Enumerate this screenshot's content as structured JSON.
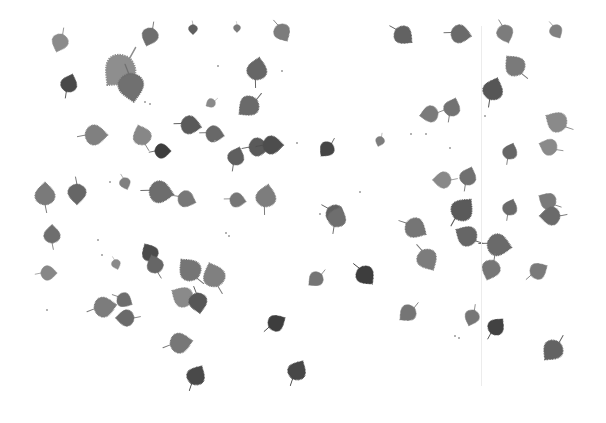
{
  "image": {
    "description": "Grayscale photograph of scattered birch leaves on a white background",
    "width": 606,
    "height": 423,
    "background": "#ffffff",
    "photo_area": {
      "x": 38,
      "y": 26,
      "w": 530,
      "h": 360
    },
    "seam_x": 481
  },
  "leaves": [
    {
      "x": 60,
      "y": 42,
      "s": 9,
      "r": -160,
      "c": "#8a8a8a"
    },
    {
      "x": 150,
      "y": 36,
      "s": 9,
      "r": 200,
      "c": "#6e6e6e"
    },
    {
      "x": 193,
      "y": 29,
      "s": 5,
      "r": 180,
      "c": "#5e5e5e"
    },
    {
      "x": 237,
      "y": 28,
      "s": 4,
      "r": 180,
      "c": "#7a7a7a"
    },
    {
      "x": 282,
      "y": 32,
      "s": 9,
      "r": 150,
      "c": "#7b7b7b"
    },
    {
      "x": 403,
      "y": 35,
      "s": 10,
      "r": 130,
      "c": "#626262"
    },
    {
      "x": 460,
      "y": 34,
      "s": 10,
      "r": 100,
      "c": "#6a6a6a"
    },
    {
      "x": 505,
      "y": 33,
      "s": 9,
      "r": 160,
      "c": "#7c7c7c"
    },
    {
      "x": 556,
      "y": 31,
      "s": 7,
      "r": 150,
      "c": "#808080"
    },
    {
      "x": 120,
      "y": 70,
      "s": 17,
      "r": -140,
      "c": "#8e8e8e"
    },
    {
      "x": 131,
      "y": 86,
      "s": 14,
      "r": 170,
      "c": "#6f6f6f"
    },
    {
      "x": 69,
      "y": 84,
      "s": 9,
      "r": 20,
      "c": "#4a4a4a"
    },
    {
      "x": 257,
      "y": 70,
      "s": 11,
      "r": 10,
      "c": "#666666"
    },
    {
      "x": 249,
      "y": 106,
      "s": 11,
      "r": -130,
      "c": "#6a6a6a"
    },
    {
      "x": 211,
      "y": 103,
      "s": 5,
      "r": -120,
      "c": "#8a8a8a"
    },
    {
      "x": 515,
      "y": 66,
      "s": 11,
      "r": -40,
      "c": "#7a7a7a"
    },
    {
      "x": 493,
      "y": 90,
      "s": 11,
      "r": 20,
      "c": "#575757"
    },
    {
      "x": 430,
      "y": 114,
      "s": 9,
      "r": -100,
      "c": "#7a7a7a"
    },
    {
      "x": 452,
      "y": 108,
      "s": 9,
      "r": 20,
      "c": "#727272"
    },
    {
      "x": 557,
      "y": 122,
      "s": 11,
      "r": -60,
      "c": "#8a8a8a"
    },
    {
      "x": 95,
      "y": 135,
      "s": 11,
      "r": 90,
      "c": "#808080"
    },
    {
      "x": 142,
      "y": 136,
      "s": 10,
      "r": -20,
      "c": "#878787"
    },
    {
      "x": 162,
      "y": 151,
      "s": 8,
      "r": 90,
      "c": "#3e3e3e"
    },
    {
      "x": 190,
      "y": 125,
      "s": 10,
      "r": 100,
      "c": "#5a5a5a"
    },
    {
      "x": 214,
      "y": 134,
      "s": 9,
      "r": 100,
      "c": "#676767"
    },
    {
      "x": 236,
      "y": 157,
      "s": 9,
      "r": 20,
      "c": "#5e5e5e"
    },
    {
      "x": 258,
      "y": 147,
      "s": 10,
      "r": 90,
      "c": "#5a5a5a"
    },
    {
      "x": 272,
      "y": 145,
      "s": 10,
      "r": 90,
      "c": "#4e4e4e"
    },
    {
      "x": 327,
      "y": 149,
      "s": 8,
      "r": -140,
      "c": "#454545"
    },
    {
      "x": 380,
      "y": 141,
      "s": 5,
      "r": -160,
      "c": "#7d7d7d"
    },
    {
      "x": 510,
      "y": 152,
      "s": 8,
      "r": 20,
      "c": "#666666"
    },
    {
      "x": 549,
      "y": 147,
      "s": 9,
      "r": -70,
      "c": "#8a8a8a"
    },
    {
      "x": 45,
      "y": 195,
      "s": 11,
      "r": 0,
      "c": "#7a7a7a"
    },
    {
      "x": 77,
      "y": 193,
      "s": 10,
      "r": 180,
      "c": "#666666"
    },
    {
      "x": 125,
      "y": 183,
      "s": 6,
      "r": 160,
      "c": "#808080"
    },
    {
      "x": 160,
      "y": 192,
      "s": 12,
      "r": 100,
      "c": "#6d6d6d"
    },
    {
      "x": 186,
      "y": 199,
      "s": 9,
      "r": 110,
      "c": "#777777"
    },
    {
      "x": 237,
      "y": 200,
      "s": 8,
      "r": 100,
      "c": "#767676"
    },
    {
      "x": 266,
      "y": 197,
      "s": 11,
      "r": 10,
      "c": "#7d7d7d"
    },
    {
      "x": 335,
      "y": 214,
      "s": 10,
      "r": 130,
      "c": "#616161"
    },
    {
      "x": 443,
      "y": 180,
      "s": 9,
      "r": -90,
      "c": "#888888"
    },
    {
      "x": 468,
      "y": 177,
      "s": 9,
      "r": 20,
      "c": "#6f6f6f"
    },
    {
      "x": 462,
      "y": 210,
      "s": 12,
      "r": 40,
      "c": "#5a5a5a"
    },
    {
      "x": 510,
      "y": 208,
      "s": 8,
      "r": 20,
      "c": "#6a6a6a"
    },
    {
      "x": 548,
      "y": 201,
      "s": 9,
      "r": -60,
      "c": "#7a7a7a"
    },
    {
      "x": 52,
      "y": 235,
      "s": 9,
      "r": 0,
      "c": "#6e6e6e"
    },
    {
      "x": 48,
      "y": 273,
      "s": 8,
      "r": 90,
      "c": "#878787"
    },
    {
      "x": 116,
      "y": 264,
      "s": 5,
      "r": 160,
      "c": "#8a8a8a"
    },
    {
      "x": 150,
      "y": 253,
      "s": 9,
      "r": -30,
      "c": "#4c4c4c"
    },
    {
      "x": 155,
      "y": 265,
      "s": 9,
      "r": -20,
      "c": "#666666"
    },
    {
      "x": 190,
      "y": 270,
      "s": 12,
      "r": -40,
      "c": "#757575"
    },
    {
      "x": 214,
      "y": 276,
      "s": 12,
      "r": -20,
      "c": "#808080"
    },
    {
      "x": 183,
      "y": 297,
      "s": 11,
      "r": -60,
      "c": "#8a8a8a"
    },
    {
      "x": 198,
      "y": 302,
      "s": 10,
      "r": 170,
      "c": "#575757"
    },
    {
      "x": 104,
      "y": 307,
      "s": 11,
      "r": 80,
      "c": "#7b7b7b"
    },
    {
      "x": 124,
      "y": 300,
      "s": 8,
      "r": 120,
      "c": "#6d6d6d"
    },
    {
      "x": 126,
      "y": 318,
      "s": 9,
      "r": -90,
      "c": "#6a6a6a"
    },
    {
      "x": 180,
      "y": 343,
      "s": 11,
      "r": 80,
      "c": "#777777"
    },
    {
      "x": 196,
      "y": 376,
      "s": 10,
      "r": 30,
      "c": "#4a4a4a"
    },
    {
      "x": 276,
      "y": 323,
      "s": 9,
      "r": 60,
      "c": "#3e3e3e"
    },
    {
      "x": 297,
      "y": 371,
      "s": 10,
      "r": 30,
      "c": "#464646"
    },
    {
      "x": 337,
      "y": 218,
      "s": 10,
      "r": 20,
      "c": "#6e6e6e"
    },
    {
      "x": 415,
      "y": 228,
      "s": 11,
      "r": 120,
      "c": "#747474"
    },
    {
      "x": 467,
      "y": 236,
      "s": 11,
      "r": -60,
      "c": "#666666"
    },
    {
      "x": 498,
      "y": 245,
      "s": 12,
      "r": 100,
      "c": "#6a6a6a"
    },
    {
      "x": 491,
      "y": 269,
      "s": 10,
      "r": 200,
      "c": "#767676"
    },
    {
      "x": 538,
      "y": 271,
      "s": 9,
      "r": 60,
      "c": "#7a7a7a"
    },
    {
      "x": 551,
      "y": 216,
      "s": 10,
      "r": -90,
      "c": "#6a6a6a"
    },
    {
      "x": 427,
      "y": 259,
      "s": 11,
      "r": 150,
      "c": "#7c7c7c"
    },
    {
      "x": 316,
      "y": 279,
      "s": 8,
      "r": -130,
      "c": "#747474"
    },
    {
      "x": 365,
      "y": 275,
      "s": 10,
      "r": 140,
      "c": "#3c3c3c"
    },
    {
      "x": 408,
      "y": 313,
      "s": 9,
      "r": -130,
      "c": "#757575"
    },
    {
      "x": 472,
      "y": 317,
      "s": 8,
      "r": 200,
      "c": "#767676"
    },
    {
      "x": 496,
      "y": 327,
      "s": 9,
      "r": 40,
      "c": "#424242"
    },
    {
      "x": 553,
      "y": 350,
      "s": 11,
      "r": -140,
      "c": "#646464"
    }
  ],
  "specks": [
    [
      145,
      102
    ],
    [
      150,
      104
    ],
    [
      218,
      66
    ],
    [
      282,
      71
    ],
    [
      110,
      182
    ],
    [
      98,
      240
    ],
    [
      102,
      255
    ],
    [
      226,
      233
    ],
    [
      229,
      236
    ],
    [
      215,
      141
    ],
    [
      320,
      214
    ],
    [
      411,
      134
    ],
    [
      426,
      134
    ],
    [
      450,
      148
    ],
    [
      485,
      116
    ],
    [
      360,
      192
    ],
    [
      297,
      143
    ],
    [
      47,
      310
    ],
    [
      455,
      336
    ],
    [
      459,
      338
    ]
  ]
}
